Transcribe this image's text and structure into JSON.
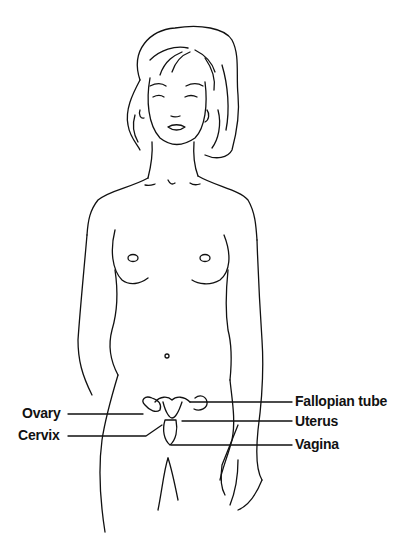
{
  "diagram": {
    "labels": {
      "left": [
        {
          "id": "ovary",
          "text": "Ovary"
        },
        {
          "id": "cervix",
          "text": "Cervix"
        }
      ],
      "right": [
        {
          "id": "fallopian_tube",
          "text": "Fallopian tube"
        },
        {
          "id": "uterus",
          "text": "Uterus"
        },
        {
          "id": "vagina",
          "text": "Vagina"
        }
      ]
    },
    "colors": {
      "line": "#111111",
      "background": "#ffffff"
    }
  }
}
